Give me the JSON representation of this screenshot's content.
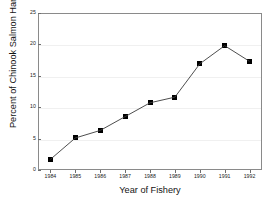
{
  "chart_data": {
    "type": "line",
    "title": "",
    "xlabel": "Year of Fishery",
    "ylabel": "Percent of Chinook Salmon Harvest",
    "categories": [
      "1984",
      "1985",
      "1986",
      "1987",
      "1988",
      "1989",
      "1990",
      "1991",
      "1992"
    ],
    "x": [
      1984,
      1985,
      1986,
      1987,
      1988,
      1989,
      1990,
      1991,
      1992
    ],
    "values": [
      1.7,
      5.1,
      6.3,
      8.5,
      10.7,
      11.6,
      16.9,
      19.8,
      17.3
    ],
    "series": [
      {
        "name": "Percent of Chinook Salmon Harvest",
        "values": [
          1.7,
          5.1,
          6.3,
          8.5,
          10.7,
          11.6,
          16.9,
          19.8,
          17.3
        ]
      }
    ],
    "ylim": [
      0,
      25
    ],
    "yticks": [
      0,
      5,
      10,
      15,
      20,
      25
    ],
    "ytick_labels": [
      "0",
      "5",
      "10",
      "15",
      "20",
      "25"
    ],
    "grid": true,
    "grid_axis": "y",
    "legend": false,
    "legend_position": "none",
    "marker": "square",
    "marker_color": "#000000",
    "line_color": "#3a3a3a",
    "grid_color": "#f0f0f0",
    "frame_color": "#8a8a8a",
    "background": "#ffffff"
  },
  "axes": {
    "x_title": "Year of Fishery",
    "y_title": "Percent of Chinook Salmon Harvest"
  }
}
